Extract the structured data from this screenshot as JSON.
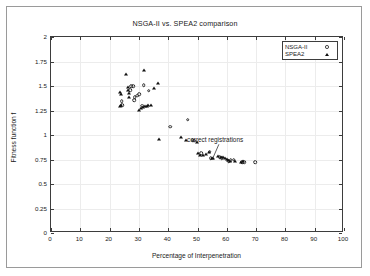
{
  "figure": {
    "title": "NSGA-II vs. SPEA2 comparison",
    "background": "#ffffff",
    "frame_color": "#9a9a9a"
  },
  "axes": {
    "x": {
      "label": "Percentage of Interpenetration",
      "min": 0,
      "max": 100,
      "ticks": [
        0,
        10,
        20,
        30,
        40,
        50,
        60,
        70,
        80,
        90,
        100
      ],
      "tick_labels": [
        "0",
        "10",
        "20",
        "30",
        "40",
        "50",
        "60",
        "70",
        "80",
        "90",
        "100"
      ]
    },
    "y": {
      "label": "Fitness function f",
      "min": 0,
      "max": 2,
      "ticks": [
        0,
        0.25,
        0.5,
        0.75,
        1,
        1.25,
        1.5,
        1.75,
        2
      ],
      "tick_labels": [
        "0",
        "0.25",
        "0.5",
        "0.75",
        "1",
        "1.25",
        "1.5",
        "1.75",
        "2"
      ]
    },
    "grid": true,
    "grid_color": "#ececec"
  },
  "legend": {
    "position": "top-right",
    "entries": [
      {
        "label": "NSGA-II",
        "marker": "open-circle",
        "color": "#2b2b2b"
      },
      {
        "label": "SPEA2",
        "marker": "filled-triangle",
        "color": "#111111"
      }
    ]
  },
  "annotations": [
    {
      "text": "correct registrations",
      "text_x": 56.0,
      "text_y": 0.955,
      "arrow_from_x": 57.3,
      "arrow_from_y": 0.905,
      "arrow_to_x": 55.4,
      "arrow_to_y": 0.775
    }
  ],
  "chart_data": {
    "type": "scatter",
    "title": "NSGA-II vs. SPEA2 comparison",
    "xlabel": "Percentage of Interpenetration",
    "ylabel": "Fitness function f",
    "xlim": [
      0,
      100
    ],
    "ylim": [
      0,
      2
    ],
    "grid": true,
    "legend_position": "top-right",
    "series": [
      {
        "name": "NSGA-II",
        "marker": "open-circle",
        "color": "#2b2b2b",
        "points": [
          [
            24.1,
            1.345
          ],
          [
            24.4,
            1.305
          ],
          [
            27.0,
            1.455
          ],
          [
            27.3,
            1.5
          ],
          [
            28.1,
            1.5
          ],
          [
            28.3,
            1.355
          ],
          [
            28.6,
            1.385
          ],
          [
            29.5,
            1.4
          ],
          [
            30.2,
            1.415
          ],
          [
            31.2,
            1.3
          ],
          [
            31.6,
            1.51
          ],
          [
            33.4,
            1.45
          ],
          [
            40.6,
            1.085
          ],
          [
            46.6,
            1.155
          ],
          [
            48.3,
            0.945
          ],
          [
            48.9,
            0.94
          ],
          [
            51.3,
            0.815
          ],
          [
            54.2,
            0.83
          ],
          [
            54.5,
            0.765
          ],
          [
            57.6,
            0.775
          ],
          [
            58.2,
            0.765
          ],
          [
            60.6,
            0.735
          ],
          [
            61.4,
            0.745
          ],
          [
            62.3,
            0.75
          ],
          [
            65.2,
            0.72
          ],
          [
            66.0,
            0.725
          ],
          [
            69.6,
            0.72
          ]
        ]
      },
      {
        "name": "SPEA2",
        "marker": "filled-triangle",
        "color": "#111111",
        "points": [
          [
            23.6,
            1.44
          ],
          [
            23.7,
            1.3
          ],
          [
            23.9,
            1.42
          ],
          [
            24.0,
            1.305
          ],
          [
            25.7,
            1.62
          ],
          [
            26.2,
            1.455
          ],
          [
            26.4,
            1.485
          ],
          [
            26.5,
            1.43
          ],
          [
            26.6,
            1.39
          ],
          [
            30.2,
            1.255
          ],
          [
            30.8,
            1.275
          ],
          [
            31.3,
            1.285
          ],
          [
            31.6,
            1.665
          ],
          [
            32.0,
            1.295
          ],
          [
            32.6,
            1.3
          ],
          [
            33.2,
            1.305
          ],
          [
            34.0,
            1.31
          ],
          [
            35.1,
            1.48
          ],
          [
            36.4,
            1.53
          ],
          [
            36.8,
            0.96
          ],
          [
            44.2,
            0.975
          ],
          [
            46.2,
            0.95
          ],
          [
            49.7,
            0.93
          ],
          [
            50.2,
            0.815
          ],
          [
            50.8,
            0.8
          ],
          [
            51.9,
            0.795
          ],
          [
            53.0,
            0.81
          ],
          [
            54.0,
            0.825
          ],
          [
            54.8,
            0.77
          ],
          [
            55.3,
            0.765
          ],
          [
            57.0,
            0.785
          ],
          [
            58.0,
            0.78
          ],
          [
            58.6,
            0.775
          ],
          [
            59.3,
            0.77
          ],
          [
            60.0,
            0.76
          ],
          [
            60.4,
            0.74
          ],
          [
            61.0,
            0.735
          ],
          [
            62.8,
            0.73
          ],
          [
            65.0,
            0.725
          ],
          [
            65.6,
            0.73
          ]
        ]
      }
    ]
  }
}
